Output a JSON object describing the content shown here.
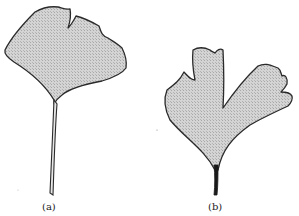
{
  "figure": {
    "panels": [
      {
        "id": "a",
        "label": "(a)",
        "subject": "ginkgo leaf with single central notch and long petiole"
      },
      {
        "id": "b",
        "label": "(b)",
        "subject": "deeply lobed ginkgo leaf with short petiole"
      }
    ],
    "colors": {
      "leaf_fill": "#cfcfcf",
      "outline": "#2a2a2a",
      "background": "#ffffff"
    }
  }
}
